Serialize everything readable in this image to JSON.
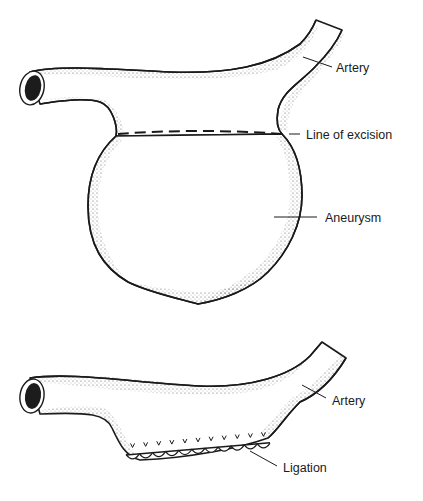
{
  "figure": {
    "top_panel": {
      "labels": {
        "artery": "Artery",
        "line_of_excision": "Line of excision",
        "aneurysm": "Aneurysm"
      }
    },
    "bottom_panel": {
      "labels": {
        "artery": "Artery",
        "ligation": "Ligation"
      },
      "suture_count": 11
    },
    "colors": {
      "ink": "#1a1a1a",
      "paper": "#ffffff"
    }
  }
}
